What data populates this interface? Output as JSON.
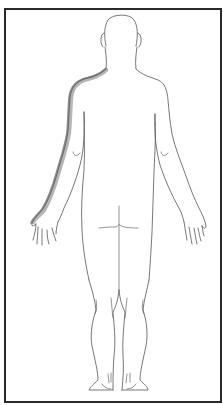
{
  "diagram": {
    "title": "Body diagram - posterior view",
    "view": "posterior",
    "frame_color": "#2a2a2a",
    "outline_color": "#555555",
    "shading": {
      "region": "left shoulder and left arm (outer edge)",
      "color": "#9a9a9a"
    }
  }
}
